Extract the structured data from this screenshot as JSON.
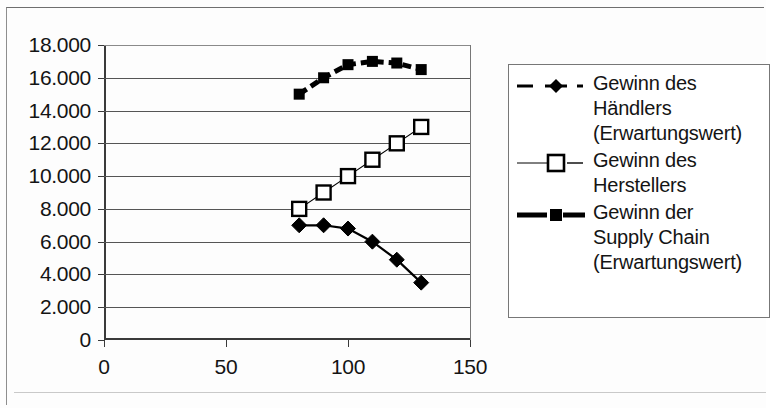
{
  "chart_data": {
    "type": "line",
    "title": "",
    "subtitle": "",
    "xlabel": "",
    "ylabel": "",
    "xlim": [
      0,
      150
    ],
    "ylim": [
      0,
      18000
    ],
    "xticks": [
      "0",
      "50",
      "100",
      "150"
    ],
    "xtick_values": [
      0,
      50,
      100,
      150
    ],
    "yticks": [
      "0",
      "2.000",
      "4.000",
      "6.000",
      "8.000",
      "10.000",
      "12.000",
      "14.000",
      "16.000",
      "18.000"
    ],
    "ytick_values": [
      0,
      2000,
      4000,
      6000,
      8000,
      10000,
      12000,
      14000,
      16000,
      18000
    ],
    "grid": "horizontal",
    "legend_position": "right",
    "x": [
      80,
      90,
      100,
      110,
      120,
      130
    ],
    "series": [
      {
        "name": "Gewinn des Händlers (Erwartungswert)",
        "marker": "filled-diamond",
        "linestyle": "solid-thin-dark",
        "color": "#000000",
        "values": [
          7000,
          7000,
          6800,
          6000,
          4900,
          3500
        ]
      },
      {
        "name": "Gewinn des Herstellers",
        "marker": "open-square",
        "linestyle": "solid-thin",
        "color": "#000000",
        "values": [
          8000,
          9000,
          10000,
          11000,
          12000,
          13000
        ]
      },
      {
        "name": "Gewinn der Supply Chain (Erwartungswert)",
        "marker": "filled-square",
        "linestyle": "thick-dashed",
        "color": "#000000",
        "values": [
          15000,
          16000,
          16800,
          17000,
          16900,
          16500
        ]
      }
    ]
  },
  "legend": {
    "entries": [
      {
        "key_icon": "dashed-line-filled-diamond-key",
        "label": "Gewinn des\nHändlers\n(Erwartungswert)"
      },
      {
        "key_icon": "thin-line-open-square-key",
        "label": "Gewinn des\nHerstellers"
      },
      {
        "key_icon": "thick-dashed-line-filled-square-key",
        "label": "Gewinn der\nSupply Chain\n(Erwartungswert)"
      }
    ]
  }
}
